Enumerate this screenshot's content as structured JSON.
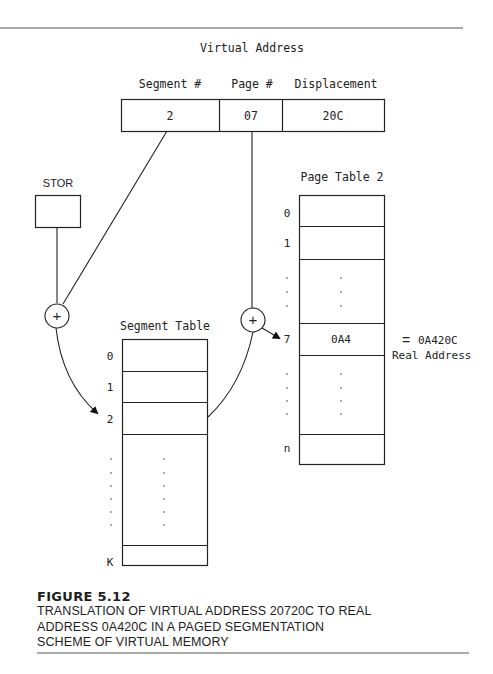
{
  "diagram": {
    "title": "Virtual Address",
    "virtual_address": {
      "fields": [
        {
          "header": "Segment #",
          "value": "2"
        },
        {
          "header": "Page #",
          "value": "07"
        },
        {
          "header": "Displacement",
          "value": "20C"
        }
      ]
    },
    "stor": {
      "label": "STOR"
    },
    "adder_symbol": "+",
    "segment_table": {
      "title": "Segment Table",
      "row_labels": [
        "0",
        "1",
        "2",
        "K"
      ],
      "ellipsis": "."
    },
    "page_table": {
      "title": "Page Table 2",
      "row_labels": [
        "0",
        "1",
        "7",
        "n"
      ],
      "entry_7_value": "0A4",
      "ellipsis": "."
    },
    "result": {
      "equals": "=",
      "value": "0A420C",
      "label": "Real Address"
    }
  },
  "caption": {
    "figure_number": "FIGURE 5.12",
    "lines": [
      "TRANSLATION OF VIRTUAL ADDRESS 20720C TO REAL",
      "ADDRESS 0A420C IN A PAGED SEGMENTATION",
      "SCHEME OF VIRTUAL MEMORY"
    ]
  }
}
